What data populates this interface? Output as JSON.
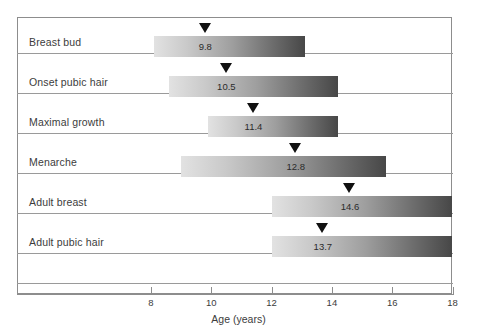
{
  "chart_data": {
    "type": "bar",
    "title": "",
    "subtitle": "",
    "xlabel": "Age (years)",
    "ylabel": "",
    "xlim": [
      6,
      18
    ],
    "xticks": [
      8,
      10,
      12,
      14,
      16,
      18
    ],
    "xtick_labels": [
      "8",
      "10",
      "12",
      "14",
      "16",
      "18"
    ],
    "grid": false,
    "legend": "none",
    "orientation": "horizontal",
    "categories": [
      "Breast bud",
      "Onset pubic hair",
      "Maximal growth",
      "Menarche",
      "Adult breast",
      "Adult pubic hair"
    ],
    "series": [
      {
        "name": "Age range (years)",
        "start": [
          8.1,
          8.6,
          9.9,
          9.0,
          12.0,
          12.0
        ],
        "end": [
          13.1,
          14.2,
          14.2,
          15.8,
          18.0,
          18.0
        ]
      },
      {
        "name": "Mean age (years)",
        "values": [
          9.8,
          10.5,
          11.4,
          12.8,
          14.6,
          13.7
        ]
      }
    ],
    "value_labels": [
      "9.8",
      "10.5",
      "11.4",
      "12.8",
      "14.6",
      "13.7"
    ],
    "colors": {
      "bar_gradient_start": "#e2e2e2",
      "bar_gradient_end": "#474747",
      "marker": "#111111",
      "frame": "#8d8d8d",
      "rowline": "#9a9a9a",
      "text": "#3c3c3c",
      "background": "#ffffff"
    }
  },
  "rows": [
    {
      "label": "Breast bud",
      "value": "9.8",
      "mean": 9.8,
      "start": 8.1,
      "end": 13.1
    },
    {
      "label": "Onset pubic hair",
      "value": "10.5",
      "mean": 10.5,
      "start": 8.6,
      "end": 14.2
    },
    {
      "label": "Maximal growth",
      "value": "11.4",
      "mean": 11.4,
      "start": 9.9,
      "end": 14.2
    },
    {
      "label": "Menarche",
      "value": "12.8",
      "mean": 12.8,
      "start": 9.0,
      "end": 15.8
    },
    {
      "label": "Adult breast",
      "value": "14.6",
      "mean": 14.6,
      "start": 12.0,
      "end": 18.0
    },
    {
      "label": "Adult pubic hair",
      "value": "13.7",
      "mean": 13.7,
      "start": 12.0,
      "end": 18.0
    }
  ],
  "axis": {
    "title": "Age (years)",
    "ticks": [
      "8",
      "10",
      "12",
      "14",
      "16",
      "18"
    ]
  }
}
